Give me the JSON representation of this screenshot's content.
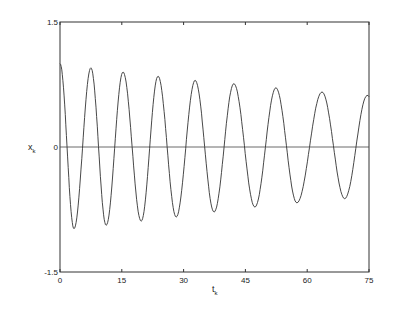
{
  "chart_data": {
    "type": "line",
    "title": "",
    "xlabel": "t_k",
    "ylabel": "x_k",
    "xlim": [
      0,
      75
    ],
    "ylim": [
      -1.5,
      1.5
    ],
    "xticks": [
      "0",
      "15",
      "30",
      "45",
      "60",
      "75"
    ],
    "yticks": [
      "1.5",
      "0",
      "-1.5"
    ],
    "grid": false,
    "legend": null,
    "zero_line": true,
    "series": [
      {
        "name": "x_k",
        "description": "damped oscillation starting at ~1.0, slowly decaying amplitude, slightly lengthening period",
        "peaks": [
          {
            "t": 0.0,
            "x": 1.0
          },
          {
            "t": 7.5,
            "x": 0.95
          },
          {
            "t": 15.3,
            "x": 0.9
          },
          {
            "t": 23.8,
            "x": 0.85
          },
          {
            "t": 32.8,
            "x": 0.8
          },
          {
            "t": 42.2,
            "x": 0.76
          },
          {
            "t": 52.4,
            "x": 0.71
          },
          {
            "t": 63.6,
            "x": 0.66
          }
        ],
        "troughs": [
          {
            "t": 3.4,
            "x": -0.98
          },
          {
            "t": 11.2,
            "x": -0.94
          },
          {
            "t": 19.7,
            "x": -0.89
          },
          {
            "t": 28.2,
            "x": -0.84
          },
          {
            "t": 37.4,
            "x": -0.78
          },
          {
            "t": 47.3,
            "x": -0.72
          },
          {
            "t": 57.5,
            "x": -0.67
          },
          {
            "t": 69.1,
            "x": -0.62
          }
        ],
        "end": {
          "t": 75,
          "x": 0.57
        }
      }
    ]
  },
  "axes": {
    "x_label": "t",
    "x_label_sub": "k",
    "y_label": "x",
    "y_label_sub": "k"
  }
}
